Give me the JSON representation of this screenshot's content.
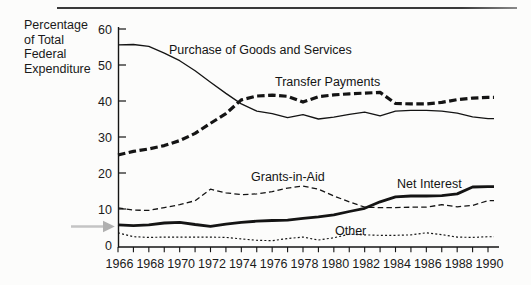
{
  "figure": {
    "y_axis_title": "Percentage\nof Total\nFederal\nExpenditure"
  },
  "colors": {
    "line": "#141414",
    "text": "#1a1a1a",
    "top_rule": "#3a3a3a",
    "arrow": "#b0b0b0",
    "background": "#fcfcfb"
  },
  "chart_data": {
    "type": "line",
    "title": "",
    "xlabel": "",
    "ylabel": "Percentage of Total Federal Expenditure",
    "ylim": [
      0,
      60
    ],
    "xlim": [
      1966,
      1990
    ],
    "grid": false,
    "legend": "inline-labels",
    "y_ticks": [
      0,
      10,
      20,
      30,
      40,
      50,
      60
    ],
    "x_tick_step_years": 1,
    "x_tick_labels": [
      "1966",
      "1968",
      "1970",
      "1972",
      "1974",
      "1976",
      "1978",
      "1980",
      "1982",
      "1984",
      "1986",
      "1988",
      "1990"
    ],
    "x": [
      1966,
      1967,
      1968,
      1969,
      1970,
      1971,
      1972,
      1973,
      1974,
      1975,
      1976,
      1977,
      1978,
      1979,
      1980,
      1981,
      1982,
      1983,
      1984,
      1985,
      1986,
      1987,
      1988,
      1989,
      1990
    ],
    "series": [
      {
        "name": "Purchase of Goods and Services",
        "style": "thin-solid",
        "values": [
          55.6,
          55.7,
          55.2,
          53.3,
          51.2,
          48.4,
          45.2,
          42.1,
          39.2,
          37.2,
          36.5,
          35.4,
          36.2,
          35.0,
          35.5,
          36.3,
          36.9,
          35.9,
          37.2,
          37.4,
          37.4,
          37.2,
          36.6,
          35.6,
          35.1
        ]
      },
      {
        "name": "Transfer Payments",
        "style": "thick-dashed",
        "values": [
          25.0,
          26.0,
          26.7,
          27.6,
          29.0,
          31.0,
          33.8,
          36.5,
          40.3,
          41.4,
          41.6,
          41.3,
          39.7,
          41.2,
          41.7,
          42.0,
          42.2,
          42.4,
          39.3,
          39.2,
          39.2,
          39.6,
          40.4,
          40.8,
          41.0
        ]
      },
      {
        "name": "Grants-in-Aid",
        "style": "thin-dashed",
        "values": [
          10.3,
          9.7,
          9.6,
          10.4,
          11.2,
          12.3,
          15.5,
          14.5,
          14.0,
          14.2,
          14.8,
          15.8,
          16.4,
          15.5,
          13.6,
          12.0,
          10.5,
          10.4,
          10.4,
          10.5,
          10.5,
          11.2,
          10.6,
          11.0,
          12.3
        ]
      },
      {
        "name": "Net Interest",
        "style": "thick-solid",
        "values": [
          5.6,
          5.4,
          5.6,
          6.1,
          6.3,
          5.7,
          5.2,
          5.8,
          6.3,
          6.6,
          6.8,
          6.9,
          7.4,
          7.8,
          8.4,
          9.3,
          10.2,
          12.0,
          13.4,
          13.6,
          13.6,
          13.7,
          14.2,
          16.1,
          16.2
        ]
      },
      {
        "name": "Other",
        "style": "fine-dotted",
        "values": [
          3.4,
          2.3,
          2.1,
          2.2,
          2.2,
          2.2,
          2.2,
          2.1,
          1.7,
          1.3,
          1.2,
          1.8,
          2.2,
          1.4,
          2.0,
          3.0,
          2.8,
          2.7,
          2.7,
          2.8,
          3.4,
          2.9,
          2.2,
          2.1,
          2.3
        ]
      }
    ],
    "annotations": [
      {
        "type": "arrow",
        "points_at": "Net Interest line start (1966)",
        "color": "#b0b0b0"
      }
    ]
  }
}
